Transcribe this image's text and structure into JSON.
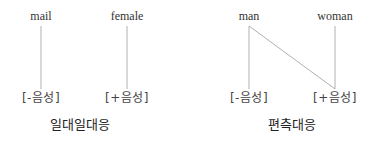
{
  "left_diagram": {
    "words": [
      "mail",
      "female"
    ],
    "features": [
      "[-음성]",
      "[+음성]"
    ],
    "caption": "일대일대응"
  },
  "right_diagram": {
    "words": [
      "man",
      "woman"
    ],
    "features": [
      "[-음성]",
      "[+음성]"
    ],
    "caption": "편측대응"
  },
  "colors": {
    "line": "#aaaaaa",
    "text": "#333333"
  }
}
